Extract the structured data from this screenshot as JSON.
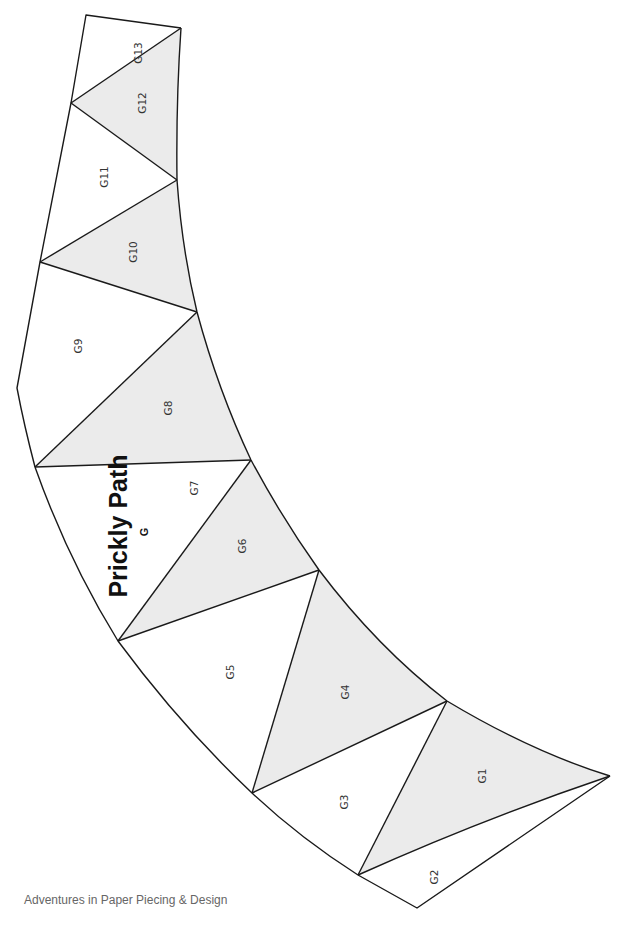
{
  "pattern": {
    "title": "Prickly Path",
    "section": "G",
    "shaded_color": "#ebebeb",
    "line_color": "#1a1a1a"
  },
  "pieces": [
    {
      "id": "G1",
      "label": "G1",
      "shaded": true
    },
    {
      "id": "G2",
      "label": "G2",
      "shaded": false
    },
    {
      "id": "G3",
      "label": "G3",
      "shaded": false
    },
    {
      "id": "G4",
      "label": "G4",
      "shaded": true
    },
    {
      "id": "G5",
      "label": "G5",
      "shaded": false
    },
    {
      "id": "G6",
      "label": "G6",
      "shaded": true
    },
    {
      "id": "G7",
      "label": "G7",
      "shaded": false
    },
    {
      "id": "G8",
      "label": "G8",
      "shaded": true
    },
    {
      "id": "G9",
      "label": "G9",
      "shaded": false
    },
    {
      "id": "G10",
      "label": "G10",
      "shaded": true
    },
    {
      "id": "G11",
      "label": "G11",
      "shaded": false
    },
    {
      "id": "G12",
      "label": "G12",
      "shaded": true
    },
    {
      "id": "G13",
      "label": "G13",
      "shaded": false
    }
  ],
  "footer": {
    "text": "Adventures in Paper Piecing & Design"
  }
}
